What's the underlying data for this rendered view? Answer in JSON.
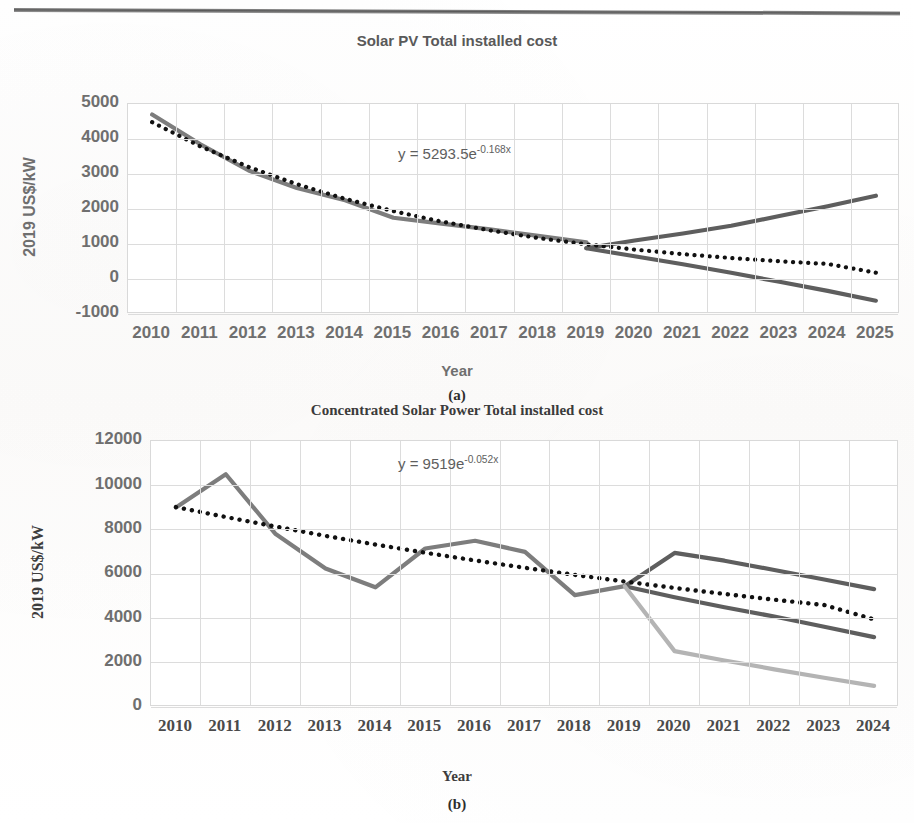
{
  "document": {
    "page_number": "",
    "header_rule": true
  },
  "charts": [
    {
      "id": "a",
      "caption": "(a)",
      "axis_label_y": "2019 US$/kW",
      "axis_label_x": "Year",
      "annotation_prefix": "y = 5293.5e",
      "annotation_exponent": "-0.168x"
    },
    {
      "id": "b",
      "caption": "(b)",
      "axis_label_y": "2019 US$/kW",
      "axis_label_x": "Year",
      "annotation_prefix": "y = 9519e",
      "annotation_exponent": "-0.052x"
    }
  ],
  "colors": {
    "historical_line": "#7d7d7d",
    "forecast_high": "#5e5e5e",
    "forecast_low": "#5e5e5e",
    "forecast_extra_low": "#b4b4b4",
    "trendline": "#111111",
    "grid": "#dcdcdc",
    "tick_text": "#6f6f6f",
    "title_text": "#3b3b3b"
  },
  "chart_data": [
    {
      "type": "line",
      "title": "Solar PV Total installed cost",
      "xlabel": "Year",
      "ylabel": "2019 US$/kW",
      "ylim": [
        -1000,
        5000
      ],
      "ytick_labels": [
        "5000",
        "4000",
        "3000",
        "2000",
        "1000",
        "0",
        "-1000"
      ],
      "yticks": [
        5000,
        4000,
        3000,
        2000,
        1000,
        0,
        -1000
      ],
      "grid": true,
      "legend": "none",
      "annotation": "y = 5293.5e^-0.168x",
      "trendline_equation": {
        "a": 5293.5,
        "b": -0.168,
        "form": "y = a*e^(b*x)"
      },
      "categories": [
        "2010",
        "2011",
        "2012",
        "2013",
        "2014",
        "2015",
        "2016",
        "2017",
        "2018",
        "2019",
        "2020",
        "2021",
        "2022",
        "2023",
        "2024",
        "2025"
      ],
      "series": [
        {
          "name": "Historical total installed cost",
          "color": "#7d7d7d",
          "style": "solid",
          "values": [
            4700,
            3850,
            3100,
            2600,
            2250,
            1750,
            1580,
            1420,
            1230,
            1050,
            null,
            null,
            null,
            null,
            null,
            null
          ]
        },
        {
          "name": "Forecast upper bound",
          "color": "#5e5e5e",
          "style": "solid",
          "values": [
            null,
            null,
            null,
            null,
            null,
            null,
            null,
            null,
            null,
            880,
            1100,
            1300,
            1520,
            1800,
            2080,
            2380
          ]
        },
        {
          "name": "Forecast lower bound",
          "color": "#5e5e5e",
          "style": "solid",
          "values": [
            null,
            null,
            null,
            null,
            null,
            null,
            null,
            null,
            null,
            880,
            650,
            420,
            180,
            -80,
            -340,
            -620
          ]
        },
        {
          "name": "Exponential trendline",
          "color": "#111111",
          "style": "dotted",
          "values": [
            4480,
            3790,
            3200,
            2710,
            2290,
            1940,
            1640,
            1390,
            1170,
            990,
            840,
            710,
            600,
            505,
            430,
            180
          ]
        }
      ]
    },
    {
      "type": "line",
      "title": "Concentrated Solar Power Total installed cost",
      "xlabel": "Year",
      "ylabel": "2019 US$/kW",
      "ylim": [
        0,
        12000
      ],
      "ytick_labels": [
        "12000",
        "10000",
        "8000",
        "6000",
        "4000",
        "2000",
        "0"
      ],
      "yticks": [
        12000,
        10000,
        8000,
        6000,
        4000,
        2000,
        0
      ],
      "grid": true,
      "legend": "none",
      "annotation": "y = 9519e^-0.052x",
      "trendline_equation": {
        "a": 9519,
        "b": -0.052,
        "form": "y = a*e^(b*x)"
      },
      "categories": [
        "2010",
        "2011",
        "2012",
        "2013",
        "2014",
        "2015",
        "2016",
        "2017",
        "2018",
        "2019",
        "2020",
        "2021",
        "2022",
        "2023",
        "2024"
      ],
      "series": [
        {
          "name": "Historical total installed cost",
          "color": "#7d7d7d",
          "style": "solid",
          "values": [
            9000,
            10500,
            7800,
            6250,
            5400,
            7150,
            7500,
            7000,
            5050,
            5450,
            null,
            null,
            null,
            null,
            null
          ]
        },
        {
          "name": "Forecast upper bound",
          "color": "#5e5e5e",
          "style": "solid",
          "values": [
            null,
            null,
            null,
            null,
            null,
            null,
            null,
            null,
            null,
            5450,
            6950,
            6600,
            6180,
            5750,
            5320
          ]
        },
        {
          "name": "Forecast middle bound",
          "color": "#5e5e5e",
          "style": "solid",
          "values": [
            null,
            null,
            null,
            null,
            null,
            null,
            null,
            null,
            null,
            5450,
            4950,
            4500,
            4080,
            3620,
            3150
          ]
        },
        {
          "name": "Forecast lower bound",
          "color": "#b4b4b4",
          "style": "solid",
          "values": [
            null,
            null,
            null,
            null,
            null,
            null,
            null,
            null,
            null,
            5450,
            2520,
            2100,
            1700,
            1320,
            950
          ]
        },
        {
          "name": "Exponential trendline",
          "color": "#111111",
          "style": "dotted",
          "values": [
            9020,
            8570,
            8140,
            7720,
            7330,
            6960,
            6610,
            6280,
            5960,
            5660,
            5370,
            5100,
            4840,
            4600,
            3950
          ]
        }
      ]
    }
  ]
}
